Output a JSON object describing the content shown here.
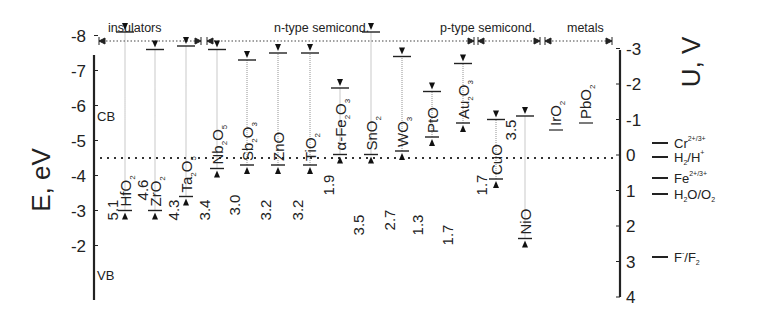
{
  "chart_data": {
    "type": "diagram-bar",
    "title": "",
    "ylabel_left": "E, eV",
    "ylabel_right": "U, V",
    "left_axis": {
      "ticks": [
        -2,
        -3,
        -4,
        -5,
        -6,
        -7,
        -8
      ],
      "range": [
        -8.5,
        -1.5
      ]
    },
    "right_axis": {
      "ticks": [
        -3,
        -2,
        -1,
        0,
        1,
        2,
        3,
        4
      ],
      "range": [
        -3,
        4
      ]
    },
    "reference_line": {
      "E": -4.5,
      "U": 0,
      "style": "dotted"
    },
    "categories_header": [
      {
        "label": "insulators",
        "from": "HfO2",
        "to": "Ta2O5"
      },
      {
        "label": "n-type semicond.",
        "from": "Nb2O5",
        "to": "PtO"
      },
      {
        "label": "p-type semicond.",
        "from": "Au2O3",
        "to": "NiO"
      },
      {
        "label": "metals",
        "from": "IrO2",
        "to": "PbO2"
      }
    ],
    "band_labels": {
      "cb": "CB",
      "vb": "VB"
    },
    "materials": [
      {
        "name": "HfO",
        "sub": "2",
        "cb": -3.0,
        "vb": -8.1,
        "gap": "5.1"
      },
      {
        "name": "ZrO",
        "sub": "2",
        "cb": -3.0,
        "vb": -7.6,
        "gap": "4.6"
      },
      {
        "name": "Ta",
        "sub": "2",
        "name2": "O",
        "sub2": "5",
        "cb": -3.4,
        "vb": -7.7,
        "gap": "4.3"
      },
      {
        "name": "Nb",
        "sub": "2",
        "name2": "O",
        "sub2": "5",
        "cb": -4.2,
        "vb": -7.6,
        "gap": "3.4"
      },
      {
        "name": "Sb",
        "sub": "2",
        "name2": "O",
        "sub2": "3",
        "cb": -4.3,
        "vb": -7.3,
        "gap": "3.0"
      },
      {
        "name": "ZnO",
        "sub": "",
        "cb": -4.3,
        "vb": -7.5,
        "gap": "3.2"
      },
      {
        "name": "TiO",
        "sub": "2",
        "cb": -4.3,
        "vb": -7.5,
        "gap": "3.2"
      },
      {
        "name": "α-Fe",
        "sub": "2",
        "name2": "O",
        "sub2": "3",
        "cb": -4.6,
        "vb": -6.5,
        "gap": "1.9"
      },
      {
        "name": "SnO",
        "sub": "2",
        "cb": -4.6,
        "vb": -8.1,
        "gap": "3.5"
      },
      {
        "name": "WO",
        "sub": "3",
        "cb": -4.7,
        "vb": -7.4,
        "gap": "2.7"
      },
      {
        "name": "PtO",
        "sub": "",
        "cb": -5.1,
        "vb": -6.4,
        "gap": "1.3"
      },
      {
        "name": "Au",
        "sub": "2",
        "name2": "O",
        "sub2": "3",
        "cb": -5.5,
        "vb": -7.2,
        "gap": "1.7"
      },
      {
        "name": "CuO",
        "sub": "",
        "cb": -3.9,
        "vb": -5.6,
        "gap": "1.7"
      },
      {
        "name": "NiO",
        "sub": "",
        "cb": -2.2,
        "vb": -5.7,
        "gap": "3.5"
      },
      {
        "name": "IrO",
        "sub": "2",
        "level": -5.3
      },
      {
        "name": "PbO",
        "sub": "2",
        "level": -5.5
      }
    ],
    "redox_couples": [
      {
        "label": "Cr",
        "sup": "2+/3+",
        "U": 0.15
      },
      {
        "label": "H",
        "sub": "2",
        "label2": "/H",
        "sup": "+",
        "U": 0.0
      },
      {
        "label": "Fe",
        "sup": "2+/3+",
        "U": 0.77
      },
      {
        "label": "H",
        "sub": "2",
        "label2": "O/O",
        "sub2": "2",
        "U": 1.23
      },
      {
        "label": "F",
        "sup": "-",
        "label2": "/F",
        "sub2": "2",
        "U": 2.87
      }
    ]
  }
}
